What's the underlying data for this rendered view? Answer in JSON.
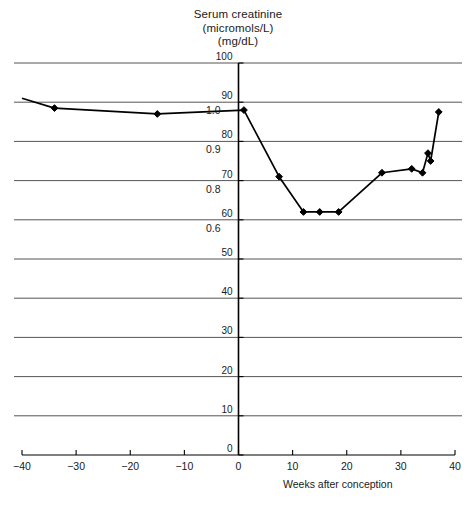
{
  "chart_data": {
    "type": "line",
    "title": "Serum creatinine",
    "title_lines": [
      "Serum creatinine",
      "(micromols/L)",
      "(mg/dL)"
    ],
    "unit_primary": "micromols/L",
    "unit_secondary": "mg/dL",
    "xlabel": "Weeks after conception",
    "ylabel": "",
    "xlim": [
      -40,
      40
    ],
    "ylim": [
      0,
      100
    ],
    "grid": true,
    "legend": "none",
    "xticks": [
      -40,
      -30,
      -20,
      -10,
      0,
      10,
      20,
      30,
      40
    ],
    "xtick_labels": [
      "−40",
      "−30",
      "−20",
      "−10",
      "0",
      "10",
      "20",
      "30",
      "40"
    ],
    "yticks": [
      0,
      10,
      20,
      30,
      40,
      50,
      60,
      70,
      80,
      90,
      100
    ],
    "ytick_labels": [
      "0",
      "10",
      "20",
      "30",
      "40",
      "50",
      "60",
      "70",
      "80",
      "90",
      "100"
    ],
    "secondary_axis_labels": [
      {
        "label": "1.0",
        "at_umol": 90
      },
      {
        "label": "0.9",
        "at_umol": 80
      },
      {
        "label": "0.8",
        "at_umol": 70
      },
      {
        "label": "0.6",
        "at_umol": 60
      }
    ],
    "series": [
      {
        "name": "Serum creatinine",
        "marker": "diamond",
        "color": "#000000",
        "x": [
          -40,
          -34,
          -15,
          1,
          7.5,
          12,
          15,
          18.5,
          26.5,
          32,
          34,
          35,
          35.5,
          37
        ],
        "y": [
          91,
          88.5,
          87,
          88,
          71,
          62,
          62,
          62,
          72,
          73,
          72,
          77,
          75,
          87.5
        ]
      }
    ]
  },
  "axis_titles": {
    "x": "Weeks after conception"
  }
}
